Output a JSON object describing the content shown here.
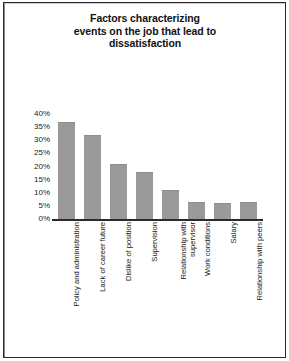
{
  "figure": {
    "title_lines": [
      "Factors characterizing",
      "events on the job that lead to",
      "dissatisfaction"
    ],
    "bar_color": "#9a9a9a",
    "axis_color": "#2b2b2b",
    "frame_color": "#2b2b2b",
    "background": "#ffffff"
  },
  "chart_data": {
    "type": "bar",
    "xlabel": "",
    "ylabel": "",
    "categories": [
      "Policy and administration",
      "Lack of career future",
      "Dislike of position",
      "Supervision",
      "Relationship with supervisor",
      "Work conditions",
      "Salary",
      "Relationship with peers"
    ],
    "category_lines": [
      [
        "Policy and administration"
      ],
      [
        "Lack of career future"
      ],
      [
        "Dislike of position"
      ],
      [
        "Supervision"
      ],
      [
        "Relationship with",
        "supervisor"
      ],
      [
        "Work conditions"
      ],
      [
        "Salary"
      ],
      [
        "Relationship with peers"
      ]
    ],
    "values": [
      37,
      32,
      21,
      18,
      11,
      6.5,
      6,
      6.5
    ],
    "ylim": [
      0,
      40
    ],
    "ytick_values": [
      40,
      35,
      30,
      25,
      20,
      15,
      10,
      5,
      0
    ],
    "ytick_labels": [
      "40%",
      "35%",
      "30%",
      "25%",
      "20%",
      "15%",
      "10%",
      "5%",
      "0%"
    ],
    "grid": false,
    "legend": null
  }
}
